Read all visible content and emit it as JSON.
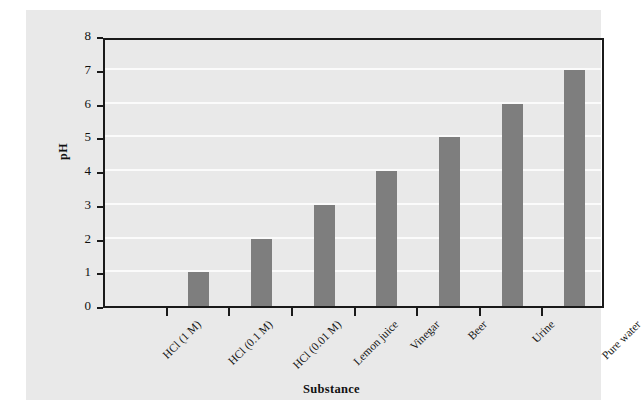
{
  "chart_data": {
    "type": "bar",
    "title": "",
    "xlabel": "Substance",
    "ylabel": "pH",
    "categories": [
      "HCl (1 M)",
      "HCl (0.1 M)",
      "HCl (0.01 M)",
      "Lemon juice",
      "Vinegar",
      "Beer",
      "Urine",
      "Pure water"
    ],
    "values": [
      0,
      1,
      2,
      3,
      4,
      5,
      6,
      7
    ],
    "ylim": [
      0,
      8
    ],
    "yticks": [
      0,
      1,
      2,
      3,
      4,
      5,
      6,
      7,
      8
    ],
    "ytick_labels": [
      "0",
      "1",
      "2",
      "3",
      "4",
      "5",
      "6",
      "7",
      "8"
    ],
    "grid": true,
    "grid_axis": "y",
    "legend": false,
    "legend_position": "none",
    "bar_color": "#7e7e7e",
    "grid_color": "#fbfbfb",
    "panel_color": "#e9e9e9",
    "axis_color": "#1a1a1a",
    "figure_background": "#ffffff"
  }
}
